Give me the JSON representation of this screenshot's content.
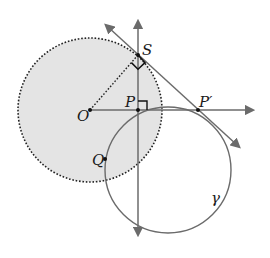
{
  "diagram": {
    "type": "geometry",
    "colors": {
      "fill_region": "#e4e4e4",
      "dotted_circle": "#222222",
      "line": "#6b6b6b",
      "point": "#111111",
      "text": "#1a1a1a"
    },
    "points": [
      {
        "id": "O",
        "label": "O",
        "x": 90,
        "y": 110
      },
      {
        "id": "P",
        "label": "P",
        "x": 138,
        "y": 110
      },
      {
        "id": "P_prime",
        "label": "P′",
        "x": 198,
        "y": 110
      },
      {
        "id": "S",
        "label": "S",
        "x": 138,
        "y": 55
      },
      {
        "id": "Q",
        "label": "Q",
        "x": 105,
        "y": 159
      }
    ],
    "circles": [
      {
        "id": "inversion-circle",
        "center": "O",
        "cx": 90,
        "cy": 110,
        "r": 72,
        "style": "dotted",
        "filled": true
      },
      {
        "id": "gamma",
        "label": "γ",
        "cx": 168,
        "cy": 170,
        "r": 63,
        "style": "solid"
      }
    ],
    "lines": [
      {
        "id": "vertical-line-through-P",
        "from": [
          138,
          16
        ],
        "to": [
          138,
          240
        ],
        "arrows": "both"
      },
      {
        "id": "ray-O-through-P",
        "from": [
          90,
          110
        ],
        "to": [
          258,
          110
        ],
        "arrows": "end"
      },
      {
        "id": "tangent-S-P-prime",
        "from": [
          102,
          22
        ],
        "to": [
          243,
          150
        ],
        "arrows": "both"
      },
      {
        "id": "radius-O-S",
        "from": [
          90,
          110
        ],
        "to": [
          138,
          55
        ],
        "style": "dotted"
      }
    ],
    "right_angles": [
      "at S between OS and SP′",
      "at P between OP and PS"
    ],
    "labels": {
      "O": "O",
      "P": "P",
      "P_prime": "P′",
      "S": "S",
      "Q": "Q",
      "gamma": "γ"
    }
  }
}
